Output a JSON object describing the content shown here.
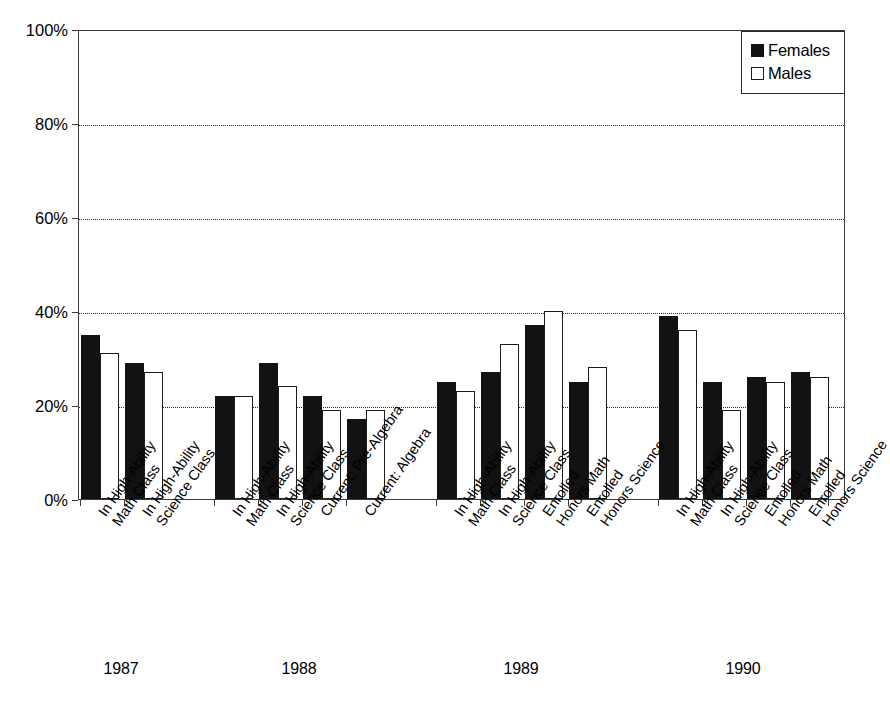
{
  "chart_data": {
    "type": "bar",
    "title": "",
    "subtitle": "",
    "xlabel": "",
    "ylabel": "",
    "ylim": [
      0,
      100
    ],
    "yticks": [
      "0%",
      "20%",
      "40%",
      "60%",
      "80%",
      "100%"
    ],
    "ytick_values": [
      0,
      20,
      40,
      60,
      80,
      100
    ],
    "grid": "horizontal-dotted",
    "legend_position": "top-right",
    "legend": [
      "Females",
      "Males"
    ],
    "series": [
      {
        "name": "Females",
        "color": "#121212",
        "fill": "solid"
      },
      {
        "name": "Males",
        "color": "#ffffff",
        "fill": "outline"
      }
    ],
    "groups": [
      {
        "year": "1987",
        "categories": [
          {
            "line1": "In High-Ability",
            "line2": "Math Class",
            "Females": 35,
            "Males": 31
          },
          {
            "line1": "In High-Ability",
            "line2": "Science Class",
            "Females": 29,
            "Males": 27
          }
        ]
      },
      {
        "year": "1988",
        "categories": [
          {
            "line1": "In High-Ability",
            "line2": "Math Class",
            "Females": 22,
            "Males": 22
          },
          {
            "line1": "In High-Ability",
            "line2": "Science Class",
            "Females": 29,
            "Males": 24
          },
          {
            "line1": "Current: Pre-Algebra",
            "line2": "",
            "Females": 22,
            "Males": 19
          },
          {
            "line1": "Current: Algebra",
            "line2": "",
            "Females": 17,
            "Males": 19
          }
        ]
      },
      {
        "year": "1989",
        "categories": [
          {
            "line1": "In High-Ability",
            "line2": "Math Class",
            "Females": 25,
            "Males": 23
          },
          {
            "line1": "In High-Ability",
            "line2": "Science Class",
            "Females": 27,
            "Males": 33
          },
          {
            "line1": "Enrolled",
            "line2": "Honors Math",
            "Females": 37,
            "Males": 40
          },
          {
            "line1": "Enrolled",
            "line2": "Honors Science",
            "Females": 25,
            "Males": 28
          }
        ]
      },
      {
        "year": "1990",
        "categories": [
          {
            "line1": "In High-Ability",
            "line2": "Math Class",
            "Females": 39,
            "Males": 36
          },
          {
            "line1": "In High-Ability",
            "line2": "Science Class",
            "Females": 25,
            "Males": 19
          },
          {
            "line1": "Enrolled",
            "line2": "Honors Math",
            "Females": 26,
            "Males": 25
          },
          {
            "line1": "Enrolled",
            "line2": "Honors Science",
            "Females": 27,
            "Males": 26
          }
        ]
      }
    ]
  },
  "colors": {
    "females": "#121212",
    "males": "#ffffff",
    "axis": "#3a3a3a",
    "grid": "#2a2a2a",
    "background": "#ffffff"
  }
}
